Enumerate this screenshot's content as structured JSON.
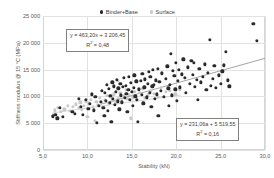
{
  "legend": {
    "position": "top-center",
    "entries": [
      {
        "label": "Binder+Base",
        "color": "#2a2a2a",
        "marker": "filled-circle-icon"
      },
      {
        "label": "Surface",
        "color": "#c9c9c9",
        "marker": "filled-circle-icon"
      }
    ]
  },
  "axes": {
    "x_title": "Stability (kN)",
    "y_title": "Stiffness modulus @ 15 °C (MPa)",
    "x_ticks": [
      "5,0",
      "10,0",
      "15,0",
      "20,0",
      "25,0",
      "30,0"
    ],
    "y_ticks": [
      "0",
      "5 000",
      "10 000",
      "15 000",
      "20 000",
      "25 000"
    ]
  },
  "annotations": {
    "binder_eq_line1": "y = 463,20x + 3 206,45",
    "binder_eq_r2_label": "R",
    "binder_eq_r2_value": " = 0,48",
    "surface_eq_line1": "y = 231,06a + 5 519,55",
    "surface_eq_r2_label": "R",
    "surface_eq_r2_value": " = 0,16",
    "superscript": "2"
  },
  "chart_data": {
    "type": "scatter",
    "title": "",
    "xlabel": "Stability (kN)",
    "ylabel": "Stiffness modulus @ 15 °C (MPa)",
    "xlim": [
      5.0,
      30.0
    ],
    "ylim": [
      0,
      25000
    ],
    "xticks": [
      5.0,
      10.0,
      15.0,
      20.0,
      25.0,
      30.0
    ],
    "yticks": [
      0,
      5000,
      10000,
      15000,
      20000,
      25000
    ],
    "grid": true,
    "legend_position": "top-center",
    "series": [
      {
        "name": "Binder+Base",
        "color": "#2a2a2a",
        "marker": "circle",
        "trendline": {
          "slope": 463.2,
          "intercept": 3206.45,
          "r2": 0.48,
          "equation": "y = 463,20x + 3 206,45",
          "color": "#9a9a9a",
          "x_start": 11.5,
          "x_end": 30.0
        },
        "points": [
          [
            6.1,
            6300
          ],
          [
            6.4,
            6550
          ],
          [
            6.6,
            5900
          ],
          [
            6.9,
            7900
          ],
          [
            7.2,
            6200
          ],
          [
            8.3,
            7100
          ],
          [
            8.6,
            6800
          ],
          [
            9.0,
            9500
          ],
          [
            9.3,
            8100
          ],
          [
            9.5,
            6600
          ],
          [
            9.8,
            9400
          ],
          [
            10.1,
            7700
          ],
          [
            10.3,
            8600
          ],
          [
            10.5,
            10400
          ],
          [
            10.7,
            7400
          ],
          [
            10.9,
            9900
          ],
          [
            11.1,
            5100
          ],
          [
            11.3,
            8300
          ],
          [
            11.5,
            9000
          ],
          [
            11.6,
            11100
          ],
          [
            11.8,
            7900
          ],
          [
            11.9,
            6400
          ],
          [
            12.0,
            10600
          ],
          [
            12.1,
            9200
          ],
          [
            12.2,
            12200
          ],
          [
            12.3,
            7300
          ],
          [
            12.4,
            11400
          ],
          [
            12.5,
            8800
          ],
          [
            12.6,
            10100
          ],
          [
            12.7,
            5200
          ],
          [
            12.8,
            12600
          ],
          [
            12.9,
            9600
          ],
          [
            13.0,
            11900
          ],
          [
            13.1,
            8400
          ],
          [
            13.2,
            10800
          ],
          [
            13.3,
            13100
          ],
          [
            13.4,
            9100
          ],
          [
            13.5,
            11500
          ],
          [
            13.6,
            7600
          ],
          [
            13.7,
            12300
          ],
          [
            13.8,
            10200
          ],
          [
            13.9,
            8900
          ],
          [
            14.0,
            11800
          ],
          [
            14.1,
            13400
          ],
          [
            14.2,
            9700
          ],
          [
            14.3,
            12000
          ],
          [
            14.4,
            10500
          ],
          [
            14.5,
            7100
          ],
          [
            14.6,
            11200
          ],
          [
            14.7,
            13700
          ],
          [
            14.8,
            9300
          ],
          [
            14.9,
            12500
          ],
          [
            15.0,
            10900
          ],
          [
            15.1,
            8200
          ],
          [
            15.2,
            11600
          ],
          [
            15.3,
            13900
          ],
          [
            15.4,
            10000
          ],
          [
            15.5,
            12800
          ],
          [
            15.6,
            9400
          ],
          [
            15.7,
            5300
          ],
          [
            15.8,
            11300
          ],
          [
            16.0,
            12900
          ],
          [
            16.1,
            10300
          ],
          [
            16.2,
            14200
          ],
          [
            16.3,
            8700
          ],
          [
            16.4,
            11700
          ],
          [
            16.5,
            13200
          ],
          [
            16.7,
            9800
          ],
          [
            16.8,
            12400
          ],
          [
            16.9,
            14600
          ],
          [
            17.0,
            10700
          ],
          [
            17.1,
            13600
          ],
          [
            17.2,
            8000
          ],
          [
            17.3,
            11900
          ],
          [
            17.4,
            14900
          ],
          [
            17.5,
            12100
          ],
          [
            17.6,
            9500
          ],
          [
            17.7,
            13000
          ],
          [
            17.8,
            10400
          ],
          [
            17.9,
            15100
          ],
          [
            18.0,
            6400
          ],
          [
            18.1,
            12700
          ],
          [
            18.3,
            11000
          ],
          [
            18.4,
            14300
          ],
          [
            18.6,
            9900
          ],
          [
            18.8,
            13300
          ],
          [
            19.0,
            15600
          ],
          [
            19.1,
            11500
          ],
          [
            19.2,
            8300
          ],
          [
            19.3,
            12200
          ],
          [
            19.4,
            17900
          ],
          [
            19.5,
            10200
          ],
          [
            19.6,
            14800
          ],
          [
            19.8,
            13800
          ],
          [
            19.9,
            11300
          ],
          [
            20.0,
            16200
          ],
          [
            20.1,
            9200
          ],
          [
            20.2,
            12900
          ],
          [
            20.3,
            15000
          ],
          [
            20.4,
            11700
          ],
          [
            20.6,
            14100
          ],
          [
            20.8,
            16900
          ],
          [
            21.0,
            13500
          ],
          [
            21.1,
            10600
          ],
          [
            21.3,
            15400
          ],
          [
            21.5,
            12300
          ],
          [
            21.7,
            16600
          ],
          [
            21.9,
            14000
          ],
          [
            22.0,
            16300
          ],
          [
            22.1,
            11800
          ],
          [
            22.3,
            13100
          ],
          [
            22.4,
            9300
          ],
          [
            22.6,
            15200
          ],
          [
            22.8,
            12600
          ],
          [
            23.0,
            13700
          ],
          [
            23.2,
            16000
          ],
          [
            23.4,
            11200
          ],
          [
            23.6,
            14400
          ],
          [
            23.8,
            20500
          ],
          [
            23.9,
            12000
          ],
          [
            24.1,
            13300
          ],
          [
            24.3,
            15700
          ],
          [
            24.5,
            11600
          ],
          [
            24.8,
            13900
          ],
          [
            25.0,
            12400
          ],
          [
            25.2,
            14700
          ],
          [
            25.4,
            15800
          ],
          [
            25.6,
            18300
          ],
          [
            25.8,
            13000
          ],
          [
            26.0,
            11900
          ],
          [
            28.7,
            23600
          ],
          [
            29.1,
            20300
          ]
        ]
      },
      {
        "name": "Surface",
        "color": "#c9c9c9",
        "marker": "circle",
        "trendline": {
          "slope": 231.06,
          "intercept": 5519.55,
          "r2": 0.16,
          "equation": "y = 231,06a + 5 519,55",
          "color": "#d0d0d0",
          "x_start": 6.0,
          "x_end": 20.5
        },
        "points": [
          [
            6.3,
            7400
          ],
          [
            6.7,
            7900
          ],
          [
            7.0,
            7100
          ],
          [
            7.4,
            7600
          ],
          [
            7.8,
            8200
          ],
          [
            8.0,
            7300
          ],
          [
            8.4,
            8000
          ],
          [
            8.7,
            8500
          ],
          [
            9.0,
            7800
          ],
          [
            9.2,
            8900
          ],
          [
            9.4,
            7500
          ],
          [
            9.6,
            8300
          ],
          [
            9.8,
            9100
          ],
          [
            10.0,
            6200
          ],
          [
            10.2,
            8700
          ],
          [
            10.4,
            9400
          ],
          [
            10.6,
            8100
          ],
          [
            10.8,
            5400
          ],
          [
            11.0,
            9000
          ],
          [
            11.2,
            8400
          ],
          [
            11.4,
            9700
          ],
          [
            11.6,
            8800
          ],
          [
            11.8,
            7900
          ],
          [
            12.0,
            9300
          ],
          [
            12.2,
            10100
          ],
          [
            12.4,
            8600
          ],
          [
            12.6,
            9900
          ],
          [
            12.8,
            9200
          ],
          [
            13.0,
            10400
          ],
          [
            13.2,
            8900
          ],
          [
            13.4,
            12900
          ],
          [
            13.5,
            9600
          ],
          [
            13.7,
            10700
          ],
          [
            13.9,
            9100
          ],
          [
            14.1,
            10000
          ],
          [
            14.3,
            11200
          ],
          [
            14.5,
            9500
          ],
          [
            14.7,
            10300
          ],
          [
            14.9,
            5900
          ],
          [
            15.1,
            9800
          ],
          [
            15.3,
            10900
          ],
          [
            15.6,
            9400
          ],
          [
            15.9,
            10600
          ],
          [
            16.2,
            11400
          ],
          [
            16.5,
            9700
          ],
          [
            16.8,
            10200
          ],
          [
            17.1,
            11000
          ],
          [
            17.5,
            10500
          ],
          [
            17.9,
            9900
          ],
          [
            18.3,
            11600
          ],
          [
            18.8,
            10800
          ],
          [
            19.3,
            11100
          ],
          [
            19.9,
            10400
          ],
          [
            20.4,
            11300
          ]
        ]
      }
    ]
  }
}
